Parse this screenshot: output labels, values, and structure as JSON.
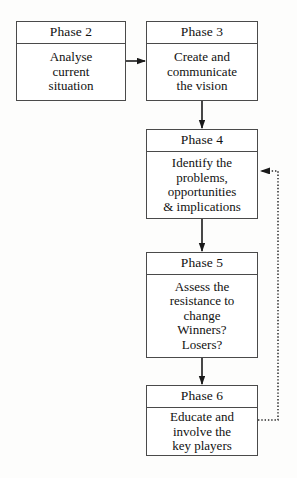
{
  "diagram": {
    "background_color": "#fdfdfc",
    "line_color": "#1a1a1a",
    "box_border_color": "#4a4a4a",
    "nodes": [
      {
        "id": "phase-2",
        "header": "Phase 2",
        "body_lines": [
          "Analyse",
          "current",
          "situation"
        ]
      },
      {
        "id": "phase-3",
        "header": "Phase 3",
        "body_lines": [
          "Create and",
          "communicate",
          "the vision"
        ]
      },
      {
        "id": "phase-4",
        "header": "Phase 4",
        "body_lines": [
          "Identify the",
          "problems,",
          "opportunities",
          "& implications"
        ]
      },
      {
        "id": "phase-5",
        "header": "Phase 5",
        "body_lines": [
          "Assess the",
          "resistance to",
          "change",
          "Winners?",
          "Losers?"
        ]
      },
      {
        "id": "phase-6",
        "header": "Phase 6",
        "body_lines": [
          "Educate and",
          "involve the",
          "key players"
        ]
      }
    ],
    "connectors": [
      {
        "id": "phase2-to-phase3",
        "style": "solid",
        "direction": "right"
      },
      {
        "id": "phase3-to-phase4",
        "style": "solid",
        "direction": "down"
      },
      {
        "id": "phase4-to-phase5",
        "style": "solid",
        "direction": "down"
      },
      {
        "id": "phase5-to-phase6",
        "style": "solid",
        "direction": "down"
      },
      {
        "id": "phase6-feedback-to-phase4",
        "style": "dotted",
        "direction": "left"
      }
    ]
  }
}
